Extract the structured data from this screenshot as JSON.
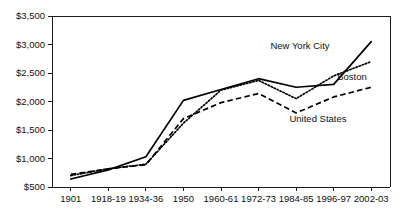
{
  "chart_data": {
    "type": "line",
    "title": "",
    "xlabel": "",
    "ylabel": "",
    "grid": false,
    "legend_position": "inline-labels",
    "categories": [
      "1901",
      "1918-19",
      "1934-36",
      "1950",
      "1960-61",
      "1972-73",
      "1984-85",
      "1996-97",
      "2002-03"
    ],
    "ylim": [
      500,
      3500
    ],
    "yticks": [
      500,
      1000,
      1500,
      2000,
      2500,
      3000,
      3500
    ],
    "ytick_labels": [
      "$500",
      "$1,000",
      "$1,500",
      "$2,000",
      "$2,500",
      "$3,000",
      "$3,500"
    ],
    "series": [
      {
        "name": "New York City",
        "style": "dotted",
        "color": "#000000",
        "values": [
          700,
          820,
          900,
          1620,
          2200,
          2370,
          2050,
          2450,
          2700
        ]
      },
      {
        "name": "Boston",
        "style": "solid",
        "color": "#000000",
        "values": [
          640,
          800,
          1030,
          2020,
          2210,
          2400,
          2250,
          2300,
          3050
        ]
      },
      {
        "name": "United States",
        "style": "dashed",
        "color": "#000000",
        "values": [
          720,
          820,
          890,
          1700,
          1980,
          2140,
          1800,
          2080,
          2250
        ]
      }
    ],
    "series_labels": [
      {
        "text": "New York City",
        "x": 300,
        "y": 49
      },
      {
        "text": "Boston",
        "x": 352,
        "y": 80
      },
      {
        "text": "United States",
        "x": 318,
        "y": 122
      }
    ]
  },
  "colors": {
    "axis": "#1a1a1a",
    "text": "#111111",
    "background": "#ffffff"
  }
}
